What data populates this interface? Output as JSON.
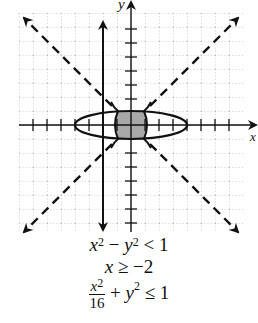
{
  "graph": {
    "x_axis_label": "x",
    "y_axis_label": "y",
    "unit_px": 14,
    "origin": [
      131,
      125
    ],
    "x_range": [
      -8,
      8
    ],
    "y_range": [
      -8,
      8
    ],
    "shaded_color": "#a8a8a8",
    "curves": [
      {
        "name": "hyperbola x^2 - y^2 = 1",
        "style": "solid"
      },
      {
        "name": "asymptote y = x",
        "style": "dashed"
      },
      {
        "name": "asymptote y = -x",
        "style": "dashed"
      },
      {
        "name": "line x = -2",
        "style": "solid"
      },
      {
        "name": "ellipse x^2/16 + y^2 = 1",
        "style": "solid"
      }
    ]
  },
  "equations": {
    "eq1": {
      "lhs_a": "x",
      "exp_a": "2",
      "minus": " − ",
      "lhs_b": "y",
      "exp_b": "2",
      "rel": " < 1"
    },
    "eq2": {
      "var": "x",
      "rel": " ≥ −2"
    },
    "eq3": {
      "num_var": "x",
      "num_exp": "2",
      "den": "16",
      "plus": " + ",
      "var": "y",
      "exp": "2",
      "rel": " ≤ 1"
    }
  }
}
